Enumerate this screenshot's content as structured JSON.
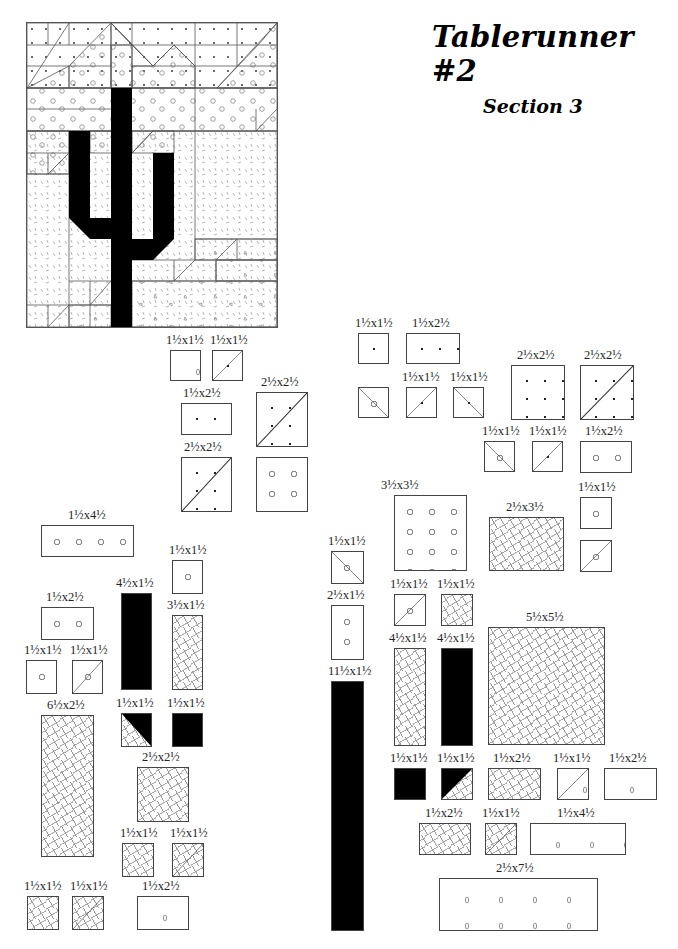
{
  "document": {
    "title": "Tablerunner #2",
    "subtitle": "Section 3"
  },
  "legend": {
    "fabrics": [
      "dots",
      "circles",
      "dashes",
      "drops",
      "black"
    ],
    "colors": {
      "ink": "#000000",
      "outline": "#444444",
      "pattern_gray": "#888888",
      "paper": "#ffffff"
    }
  },
  "pieces": [
    {
      "label": "1½x1½",
      "fabric": "drops"
    },
    {
      "label": "1½x1½",
      "fabric": "dots/drops half-square triangle"
    },
    {
      "label": "1½x2½",
      "fabric": "dots"
    },
    {
      "label": "2½x2½",
      "fabric": "dots/circles half-square triangle"
    },
    {
      "label": "2½x2½",
      "fabric": "dots/circles half-square triangle"
    },
    {
      "label": "",
      "fabric": "circles 2½x2½"
    },
    {
      "label": "1½x1½",
      "fabric": "dots"
    },
    {
      "label": "1½x2½",
      "fabric": "dots"
    },
    {
      "label": "",
      "fabric": "dots/circles triangle"
    },
    {
      "label": "1½x1½",
      "fabric": "dots/circles triangle"
    },
    {
      "label": "1½x1½",
      "fabric": "dots/circles triangle"
    },
    {
      "label": "2½x2½",
      "fabric": "dots"
    },
    {
      "label": "2½x2½",
      "fabric": "dots/circles triangle"
    },
    {
      "label": "1½x1½",
      "fabric": "dots/circles triangle"
    },
    {
      "label": "1½x1½",
      "fabric": "dots/circles triangle"
    },
    {
      "label": "1½x2½",
      "fabric": "circles"
    },
    {
      "label": "1½x4½",
      "fabric": "circles"
    },
    {
      "label": "1½x1½",
      "fabric": "circles"
    },
    {
      "label": "4½x1½",
      "fabric": "black"
    },
    {
      "label": "3½x1½",
      "fabric": "dashes"
    },
    {
      "label": "1½x2½",
      "fabric": "circles"
    },
    {
      "label": "1½x1½",
      "fabric": "circles"
    },
    {
      "label": "1½x1½",
      "fabric": "circles/dots triangle"
    },
    {
      "label": "6½x2½",
      "fabric": "dashes"
    },
    {
      "label": "1½x1½",
      "fabric": "black/dashes triangle"
    },
    {
      "label": "1½x1½",
      "fabric": "black"
    },
    {
      "label": "2½x2½",
      "fabric": "dashes"
    },
    {
      "label": "1½x1½",
      "fabric": "dashes"
    },
    {
      "label": "1½x1½",
      "fabric": "dashes/drops triangle"
    },
    {
      "label": "1½x1½",
      "fabric": "dashes"
    },
    {
      "label": "1½x1½",
      "fabric": "dashes/drops triangle"
    },
    {
      "label": "1½x2½",
      "fabric": "drops"
    },
    {
      "label": "3½x3½",
      "fabric": "circles"
    },
    {
      "label": "2½x3½",
      "fabric": "dashes"
    },
    {
      "label": "1½x1½",
      "fabric": "circles"
    },
    {
      "label": "",
      "fabric": "circles/dashes triangle"
    },
    {
      "label": "1½x1½",
      "fabric": "dots/circles triangle"
    },
    {
      "label": "2½x1½",
      "fabric": "circles"
    },
    {
      "label": "1½x1½",
      "fabric": "circles/dashes triangle"
    },
    {
      "label": "1½x1½",
      "fabric": "dashes"
    },
    {
      "label": "4½x1½",
      "fabric": "dashes"
    },
    {
      "label": "4½x1½",
      "fabric": "black"
    },
    {
      "label": "5½x5½",
      "fabric": "dashes"
    },
    {
      "label": "11½x1½",
      "fabric": "black"
    },
    {
      "label": "1½x1½",
      "fabric": "black"
    },
    {
      "label": "1½x1½",
      "fabric": "black/dashes triangle"
    },
    {
      "label": "1½x2½",
      "fabric": "dashes"
    },
    {
      "label": "1½x1½",
      "fabric": "dashes/drops triangle"
    },
    {
      "label": "1½x2½",
      "fabric": "drops"
    },
    {
      "label": "1½x2½",
      "fabric": "dashes"
    },
    {
      "label": "1½x1½",
      "fabric": "dashes/drops triangle"
    },
    {
      "label": "1½x4½",
      "fabric": "drops"
    },
    {
      "label": "2½x7½",
      "fabric": "drops"
    }
  ]
}
